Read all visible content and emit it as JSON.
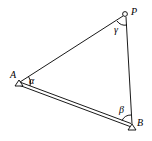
{
  "diagram": {
    "points": {
      "P": {
        "label": "P",
        "marker": "circle"
      },
      "A": {
        "label": "A",
        "marker": "triangle"
      },
      "B": {
        "label": "B",
        "marker": "triangle"
      }
    },
    "angles": {
      "alpha": {
        "label": "α",
        "vertex": "A"
      },
      "beta": {
        "label": "β",
        "vertex": "B"
      },
      "gamma": {
        "label": "γ",
        "vertex": "P"
      }
    },
    "edges": [
      {
        "from": "A",
        "to": "P",
        "style": "single"
      },
      {
        "from": "P",
        "to": "B",
        "style": "single"
      },
      {
        "from": "A",
        "to": "B",
        "style": "double",
        "meaning": "baseline"
      }
    ]
  }
}
